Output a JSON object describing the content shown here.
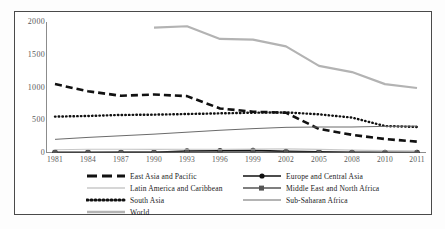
{
  "chart_data": {
    "type": "line",
    "title": "",
    "subtitle": "",
    "xlabel": "",
    "ylabel": "",
    "grid": false,
    "legend_position": "bottom",
    "ylim": [
      0,
      2000
    ],
    "yticks": [
      "0",
      "500",
      "1000",
      "1500",
      "2000"
    ],
    "ytick_values": [
      0,
      500,
      1000,
      1500,
      2000
    ],
    "categories": [
      "1981",
      "1984",
      "1987",
      "1990",
      "1993",
      "1996",
      "1999",
      "2002",
      "2005",
      "2008",
      "2010",
      "2011"
    ],
    "x": [
      1981,
      1984,
      1987,
      1990,
      1993,
      1996,
      1999,
      2002,
      2005,
      2008,
      2010,
      2011
    ],
    "series": [
      {
        "name": "East Asia and Pacific",
        "style": "thick-dashed",
        "color": "#111111",
        "values": [
          1060,
          950,
          880,
          900,
          875,
          685,
          635,
          620,
          370,
          280,
          215,
          175
        ]
      },
      {
        "name": "Europe and Central Asia",
        "style": "solid-with-markers",
        "color": "#111111",
        "values": [
          8,
          8,
          9,
          10,
          30,
          35,
          40,
          25,
          18,
          10,
          10,
          9
        ]
      },
      {
        "name": "Latin America and Caribbean",
        "style": "thin-light-gray",
        "color": "#c8c8c8",
        "values": [
          50,
          58,
          58,
          55,
          58,
          58,
          60,
          62,
          55,
          45,
          35,
          33
        ]
      },
      {
        "name": "Middle East and North Africa",
        "style": "solid-with-square-markers",
        "color": "#555555",
        "values": [
          14,
          13,
          12,
          12,
          13,
          12,
          12,
          12,
          11,
          9,
          8,
          8
        ]
      },
      {
        "name": "South Asia",
        "style": "thick-dotted",
        "color": "#111111",
        "values": [
          560,
          570,
          585,
          590,
          600,
          610,
          620,
          625,
          595,
          545,
          415,
          400
        ]
      },
      {
        "name": "Sub-Saharan Africa",
        "style": "thin-solid",
        "color": "#6b6b6b",
        "values": [
          210,
          240,
          265,
          290,
          320,
          350,
          375,
          395,
          400,
          400,
          410,
          415
        ]
      },
      {
        "name": "World",
        "style": "thick-gray",
        "color": "#b3b3b3",
        "values": [
          null,
          null,
          null,
          1930,
          1950,
          1755,
          1745,
          1640,
          1340,
          1245,
          1060,
          1000
        ]
      }
    ]
  },
  "legend": {
    "rows": [
      [
        {
          "label": "East Asia and Pacific",
          "icon": "dashed-line-swatch"
        },
        {
          "label": "Europe and Central Asia",
          "icon": "solid-marker-line-swatch"
        }
      ],
      [
        {
          "label": "Latin America and Caribbean",
          "icon": "light-gray-line-swatch"
        },
        {
          "label": "Middle East and North Africa",
          "icon": "square-marker-line-swatch"
        }
      ],
      [
        {
          "label": "South Asia",
          "icon": "dotted-line-swatch"
        },
        {
          "label": "Sub-Saharan Africa",
          "icon": "thin-solid-line-swatch"
        }
      ],
      [
        {
          "label": "World",
          "icon": "gray-line-swatch"
        }
      ]
    ]
  },
  "colors": {
    "axis": "#8c8c8c",
    "tick_text": "#595959",
    "frame": "#4a4a4a",
    "east_asia": "#111111",
    "europe": "#111111",
    "latin_america": "#c8c8c8",
    "middle_east": "#555555",
    "south_asia": "#111111",
    "sub_saharan": "#6b6b6b",
    "world": "#b3b3b3"
  }
}
